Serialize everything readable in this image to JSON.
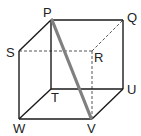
{
  "diagram": {
    "type": "cube",
    "colors": {
      "edge": "#1a1a1a",
      "hidden_edge": "#555555",
      "diagonal": "#808080",
      "label": "#222222",
      "background": "#ffffff"
    },
    "vertices": {
      "P": {
        "label": "P",
        "x": 51,
        "y": 20
      },
      "Q": {
        "label": "Q",
        "x": 123,
        "y": 20
      },
      "S": {
        "label": "S",
        "x": 19,
        "y": 51
      },
      "R": {
        "label": "R",
        "x": 92,
        "y": 51
      },
      "T": {
        "label": "T",
        "x": 51,
        "y": 89
      },
      "U": {
        "label": "U",
        "x": 123,
        "y": 89
      },
      "W": {
        "label": "W",
        "x": 19,
        "y": 119
      },
      "V": {
        "label": "V",
        "x": 92,
        "y": 119
      }
    },
    "solid_edges": [
      [
        "P",
        "Q"
      ],
      [
        "P",
        "S"
      ],
      [
        "P",
        "T"
      ],
      [
        "Q",
        "U"
      ],
      [
        "S",
        "W"
      ],
      [
        "T",
        "U"
      ],
      [
        "T",
        "W"
      ],
      [
        "W",
        "V"
      ],
      [
        "V",
        "U"
      ]
    ],
    "dashed_edges": [
      [
        "S",
        "R"
      ],
      [
        "R",
        "Q"
      ],
      [
        "R",
        "V"
      ]
    ],
    "highlighted_segment": [
      "P",
      "V"
    ]
  }
}
